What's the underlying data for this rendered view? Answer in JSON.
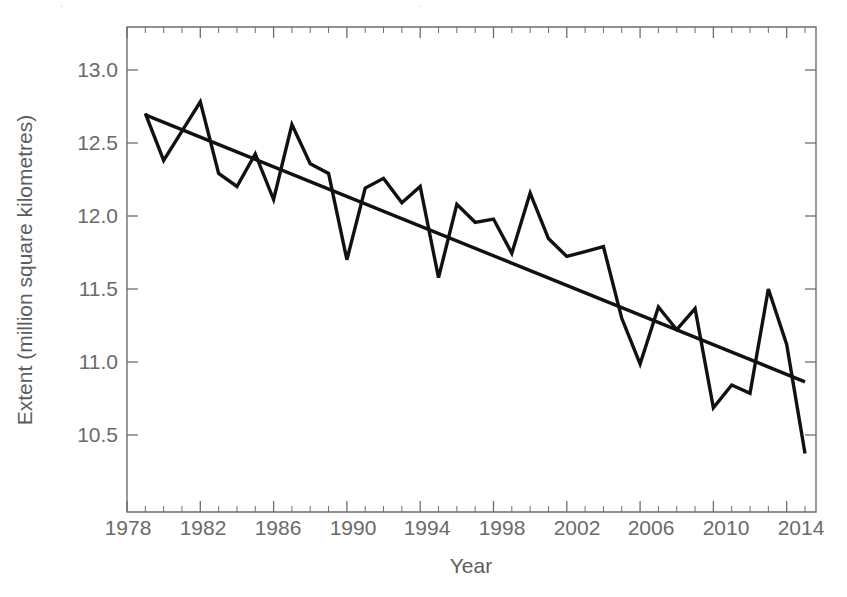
{
  "chart_data": {
    "type": "line",
    "title": "",
    "xlabel": "Year",
    "ylabel": "Extent (million square kilometres)",
    "xlim": [
      1978,
      2015.6
    ],
    "ylim": [
      10.22,
      13.2
    ],
    "grid": false,
    "legend": "none",
    "x_ticks": [
      1978,
      1982,
      1986,
      1990,
      1994,
      1998,
      2002,
      2006,
      2010,
      2014
    ],
    "x_tick_labels": [
      "1978",
      "1982",
      "1986",
      "1990",
      "1994",
      "1998",
      "2002",
      "2006",
      "2010",
      "2014"
    ],
    "x_minor_tick_interval": 1,
    "y_ticks": [
      10.5,
      11.0,
      11.5,
      12.0,
      12.5,
      13.0
    ],
    "y_tick_labels": [
      "10.5",
      "11.0",
      "11.5",
      "12.0",
      "12.5",
      "13.0"
    ],
    "series": [
      {
        "name": "Annual sea ice extent",
        "type": "line",
        "color": "#111111",
        "x": [
          1979,
          1980,
          1981,
          1982,
          1983,
          1984,
          1985,
          1986,
          1987,
          1988,
          1989,
          1990,
          1991,
          1992,
          1993,
          1994,
          1995,
          1996,
          1997,
          1998,
          1999,
          2000,
          2001,
          2002,
          2003,
          2004,
          2005,
          2006,
          2007,
          2008,
          2009,
          2010,
          2011,
          2012,
          2013,
          2014,
          2015
        ],
        "values": [
          12.67,
          12.38,
          12.56,
          12.74,
          12.3,
          12.22,
          12.42,
          12.14,
          12.6,
          12.36,
          12.3,
          11.77,
          12.21,
          12.27,
          12.12,
          12.22,
          11.66,
          12.11,
          12.0,
          12.02,
          11.81,
          12.18,
          11.9,
          11.79,
          11.82,
          11.85,
          11.41,
          11.13,
          11.48,
          11.34,
          11.47,
          10.86,
          11.0,
          10.95,
          11.59,
          11.25,
          10.58
        ]
      },
      {
        "name": "Linear trend",
        "type": "line",
        "color": "#111111",
        "x": [
          1979,
          2015
        ],
        "values": [
          12.66,
          11.02
        ]
      }
    ]
  },
  "axes": {
    "x_axis_label": "Year",
    "y_axis_label": "Extent (million square kilometres)"
  }
}
